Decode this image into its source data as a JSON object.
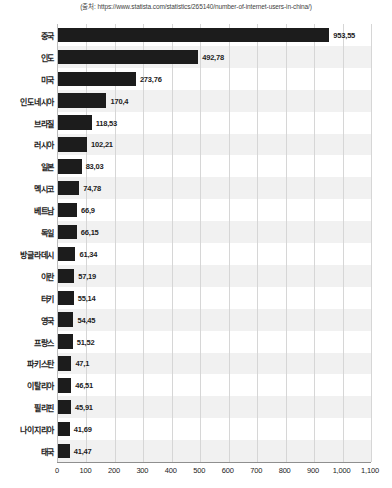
{
  "source_note": "(출처: https://www.statista.com/statistics/265140/number-of-internet-users-in-china/)",
  "chart_data": {
    "type": "bar",
    "orientation": "horizontal",
    "title": "",
    "subtitle": "",
    "xlabel": "",
    "ylabel": "",
    "xlim": [
      0,
      1100
    ],
    "grid": "vertical",
    "legend": "none",
    "value_decimal_separator": ",",
    "categories": [
      "중국",
      "인도",
      "미국",
      "인도네시아",
      "브라질",
      "러시아",
      "일본",
      "멕시코",
      "베트남",
      "독일",
      "방글라데시",
      "이란",
      "터키",
      "영국",
      "프랑스",
      "파키스탄",
      "이탈리아",
      "필리핀",
      "나이지리아",
      "태국"
    ],
    "values": [
      953.55,
      492.78,
      273.76,
      170.4,
      118.53,
      102.21,
      83.03,
      74.78,
      66.9,
      66.15,
      61.34,
      57.19,
      55.14,
      54.45,
      51.52,
      47.1,
      46.51,
      45.91,
      41.69,
      41.47
    ],
    "value_labels": [
      "953,55",
      "492,78",
      "273,76",
      "170,4",
      "118,53",
      "102,21",
      "83,03",
      "74,78",
      "66,9",
      "66,15",
      "61,34",
      "57,19",
      "55,14",
      "54,45",
      "51,52",
      "47,1",
      "46,51",
      "45,91",
      "41,69",
      "41,47"
    ],
    "x_ticks": [
      0,
      100,
      200,
      300,
      400,
      500,
      600,
      700,
      800,
      900,
      1000,
      1100
    ],
    "x_tick_labels": [
      "0",
      "100",
      "200",
      "300",
      "400",
      "500",
      "600",
      "700",
      "800",
      "900",
      "1,000",
      "1,100"
    ],
    "bar_color": "#1c1c1c",
    "band_color": "#f1f1f1",
    "grid_color": "#d6d6d6"
  }
}
